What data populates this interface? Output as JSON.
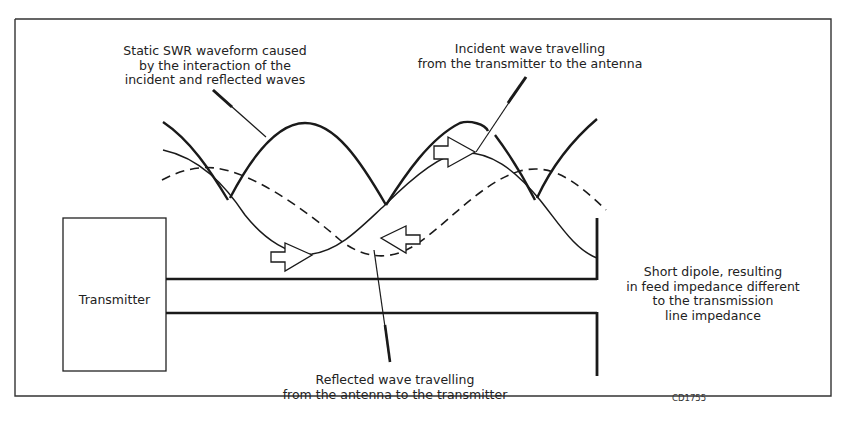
{
  "diagram": {
    "components": {
      "transmitter": {
        "label": "Transmitter"
      },
      "transmission_line": {
        "label": ""
      },
      "antenna": {
        "label": "Short dipole"
      }
    },
    "annotations": {
      "swr": {
        "lines": [
          "Static SWR waveform caused",
          "by the interaction of the",
          "incident and reflected waves"
        ]
      },
      "incident": {
        "lines": [
          "Incident wave travelling",
          "from the transmitter to the antenna"
        ]
      },
      "reflected": {
        "lines": [
          "Reflected wave travelling",
          "from the antenna to the transmitter"
        ]
      },
      "dipole": {
        "lines": [
          "Short dipole, resulting",
          "in feed impedance different",
          "to the transmission",
          "line impedance"
        ]
      }
    },
    "figure_code": "CD1755",
    "waves": [
      {
        "name": "Static SWR waveform",
        "style": "thick-solid"
      },
      {
        "name": "Incident wave",
        "style": "thin-solid",
        "direction": "toward antenna"
      },
      {
        "name": "Reflected wave",
        "style": "dashed",
        "direction": "toward transmitter"
      }
    ],
    "colors": {
      "line": "#1a1a1a",
      "background": "#ffffff"
    }
  }
}
